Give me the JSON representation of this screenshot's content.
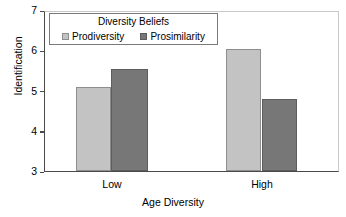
{
  "chart_data": {
    "type": "bar",
    "title": "",
    "xlabel": "Age Diversity",
    "ylabel": "Identification",
    "categories": [
      "Low",
      "High"
    ],
    "ylim": [
      3,
      7
    ],
    "yticks": [
      3,
      4,
      5,
      6,
      7
    ],
    "grid": false,
    "legend_title": "Diversity Beliefs",
    "legend_position": "top-left-inside",
    "series": [
      {
        "name": "Prodiversity",
        "color": "#c3c3c3",
        "edge_color": "#8e8e8e",
        "values": [
          5.1,
          6.05
        ]
      },
      {
        "name": "Prosimilarity",
        "color": "#777777",
        "edge_color": "#5d5d5d",
        "values": [
          5.55,
          4.8
        ]
      }
    ]
  },
  "axes": {
    "y_title": "Identification",
    "x_title": "Age Diversity",
    "y_tick_labels": [
      "7",
      "6",
      "5",
      "4",
      "3"
    ],
    "x_tick_labels": [
      "Low",
      "High"
    ]
  },
  "legend": {
    "title": "Diversity Beliefs",
    "items": [
      {
        "label": "Prodiversity"
      },
      {
        "label": "Prosimilarity"
      }
    ]
  },
  "colors": {
    "light_bar": "#c3c3c3",
    "dark_bar": "#777777",
    "axis": "#4a4a4a",
    "background": "#ffffff"
  }
}
